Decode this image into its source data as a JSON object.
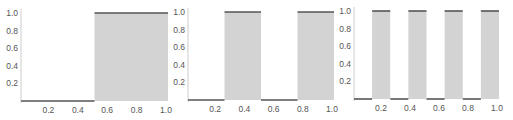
{
  "colors": {
    "fill": "#d3d3d3",
    "line": "#555555",
    "axis": "#cccccc",
    "tick_text": "#555555"
  },
  "chart_data": [
    {
      "type": "area",
      "title": "",
      "xlabel": "",
      "ylabel": "",
      "xlim": [
        0,
        1
      ],
      "ylim": [
        0,
        1
      ],
      "x_ticks": [
        "0.2",
        "0.4",
        "0.6",
        "0.8",
        "1.0"
      ],
      "y_ticks": [
        "0.2",
        "0.4",
        "0.6",
        "0.8",
        "1.0"
      ],
      "grid": false,
      "description": "Step function: 0 on [0,0.5), 1 on [0.5,1]",
      "segments": [
        {
          "x0": 0.0,
          "x1": 0.5,
          "y": 0
        },
        {
          "x0": 0.5,
          "x1": 1.0,
          "y": 1
        }
      ]
    },
    {
      "type": "area",
      "title": "",
      "xlabel": "",
      "ylabel": "",
      "xlim": [
        0,
        1
      ],
      "ylim": [
        0,
        1
      ],
      "x_ticks": [
        "0.2",
        "0.4",
        "0.6",
        "0.8",
        "1.0"
      ],
      "y_ticks": [
        "0.2",
        "0.4",
        "0.6",
        "0.8",
        "1.0"
      ],
      "grid": false,
      "description": "Square wave with 2 pulses",
      "segments": [
        {
          "x0": 0.0,
          "x1": 0.25,
          "y": 0
        },
        {
          "x0": 0.25,
          "x1": 0.5,
          "y": 1
        },
        {
          "x0": 0.5,
          "x1": 0.75,
          "y": 0
        },
        {
          "x0": 0.75,
          "x1": 1.0,
          "y": 1
        }
      ]
    },
    {
      "type": "area",
      "title": "",
      "xlabel": "",
      "ylabel": "",
      "xlim": [
        0,
        1
      ],
      "ylim": [
        0,
        1
      ],
      "x_ticks": [
        "0.2",
        "0.4",
        "0.6",
        "0.8",
        "1.0"
      ],
      "y_ticks": [
        "0.2",
        "0.4",
        "0.6",
        "0.8",
        "1.0"
      ],
      "grid": false,
      "description": "Square wave with 4 pulses",
      "segments": [
        {
          "x0": 0.0,
          "x1": 0.125,
          "y": 0
        },
        {
          "x0": 0.125,
          "x1": 0.25,
          "y": 1
        },
        {
          "x0": 0.25,
          "x1": 0.375,
          "y": 0
        },
        {
          "x0": 0.375,
          "x1": 0.5,
          "y": 1
        },
        {
          "x0": 0.5,
          "x1": 0.625,
          "y": 0
        },
        {
          "x0": 0.625,
          "x1": 0.75,
          "y": 1
        },
        {
          "x0": 0.75,
          "x1": 0.875,
          "y": 0
        },
        {
          "x0": 0.875,
          "x1": 1.0,
          "y": 1
        }
      ]
    }
  ],
  "layout": [
    {
      "left": 0,
      "axis_x": 21,
      "x_end": 168,
      "base_y": 101,
      "top_y": 13
    },
    {
      "left": 171,
      "axis_x": 188,
      "x_end": 334,
      "base_y": 100,
      "top_y": 12
    },
    {
      "left": 342,
      "axis_x": 354,
      "x_end": 499,
      "base_y": 99,
      "top_y": 11
    }
  ]
}
